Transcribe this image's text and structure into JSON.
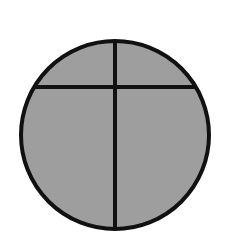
{
  "diagram": {
    "type": "fraction-circle",
    "parts": 4,
    "shaded": "all",
    "colors": {
      "background": "#ffffff",
      "fill": "#9e9e9e",
      "stroke": "#111111"
    },
    "geometry": {
      "cx": 115,
      "cy": 135,
      "r": 94,
      "stroke_width": 4,
      "vertical_line_x": 115,
      "horizontal_chord_y": 87
    }
  }
}
